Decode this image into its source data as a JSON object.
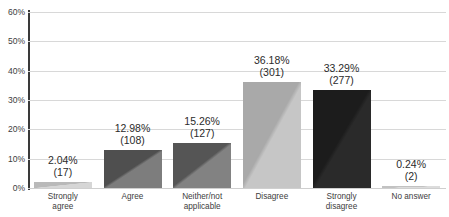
{
  "chart_data": {
    "type": "bar",
    "title": "",
    "title_cropped": true,
    "xlabel": "",
    "ylabel": "",
    "ylim": [
      0,
      60
    ],
    "yticks": [
      "0%",
      "10%",
      "20%",
      "30%",
      "40%",
      "50%",
      "60%"
    ],
    "ytick_values": [
      0,
      10,
      20,
      30,
      40,
      50,
      60
    ],
    "grid": true,
    "legend": "none",
    "categories": [
      "Strongly agree",
      "Agree",
      "Neither/not applicable",
      "Disagree",
      "Strongly disagree",
      "No answer"
    ],
    "category_lines": [
      [
        "Strongly",
        "agree"
      ],
      [
        "Agree",
        ""
      ],
      [
        "Neither/not",
        "applicable"
      ],
      [
        "Disagree",
        ""
      ],
      [
        "Strongly",
        "disagree"
      ],
      [
        "No answer",
        ""
      ]
    ],
    "values": [
      2.04,
      12.98,
      15.26,
      36.18,
      33.29,
      0.24
    ],
    "counts": [
      17,
      108,
      127,
      301,
      277,
      2
    ],
    "data_labels": [
      {
        "pct": "2.04%",
        "count": "(17)"
      },
      {
        "pct": "12.98%",
        "count": "(108)"
      },
      {
        "pct": "15.26%",
        "count": "(127)"
      },
      {
        "pct": "36.18%",
        "count": "(301)"
      },
      {
        "pct": "33.29%",
        "count": "(277)"
      },
      {
        "pct": "0.24%",
        "count": "(2)"
      }
    ],
    "bar_colors_dark": [
      "#b9b9b9",
      "#4f4f4f",
      "#555555",
      "#a9a9a9",
      "#1c1c1c",
      "#c2c2c2"
    ],
    "bar_colors_light": [
      "#d6d6d6",
      "#7d7d7d",
      "#828282",
      "#c6c6c6",
      "#2a2a2a",
      "#dcdcdc"
    ],
    "axis_color": "#3a3a3a",
    "grid_color": "#d8d8d8",
    "text_color": "#2b2b2b",
    "background": "#ffffff"
  }
}
